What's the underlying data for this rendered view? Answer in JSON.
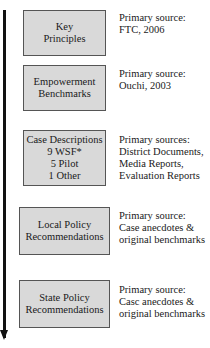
{
  "diagram": {
    "arrow": {
      "direction": "down"
    },
    "steps": [
      {
        "box_lines": [
          "Key",
          "Principles"
        ],
        "source_lines": [
          "Primary source:",
          "FTC, 2006"
        ]
      },
      {
        "box_lines": [
          "Empowerment",
          "Benchmarks"
        ],
        "source_lines": [
          "Primary source:",
          "Ouchi, 2003"
        ]
      },
      {
        "box_lines": [
          "Case Descriptions",
          "9 WSF*",
          "5 Pilot",
          "1 Other"
        ],
        "source_lines": [
          "Primary sources:",
          "District Documents,",
          "Media Reports,",
          "Evaluation Reports"
        ]
      },
      {
        "box_lines": [
          "Local Policy",
          "Recommendations"
        ],
        "source_lines": [
          "Primary source:",
          "Case anecdotes &",
          "original benchmarks"
        ]
      },
      {
        "box_lines": [
          "State Policy",
          "Recommendations"
        ],
        "source_lines": [
          "Primary source:",
          "Casc anecdotes &",
          "original benchmarks"
        ]
      }
    ]
  },
  "colors": {
    "box_fill": "#d9d9d9",
    "box_border": "#555555",
    "arrow": "#111111"
  }
}
